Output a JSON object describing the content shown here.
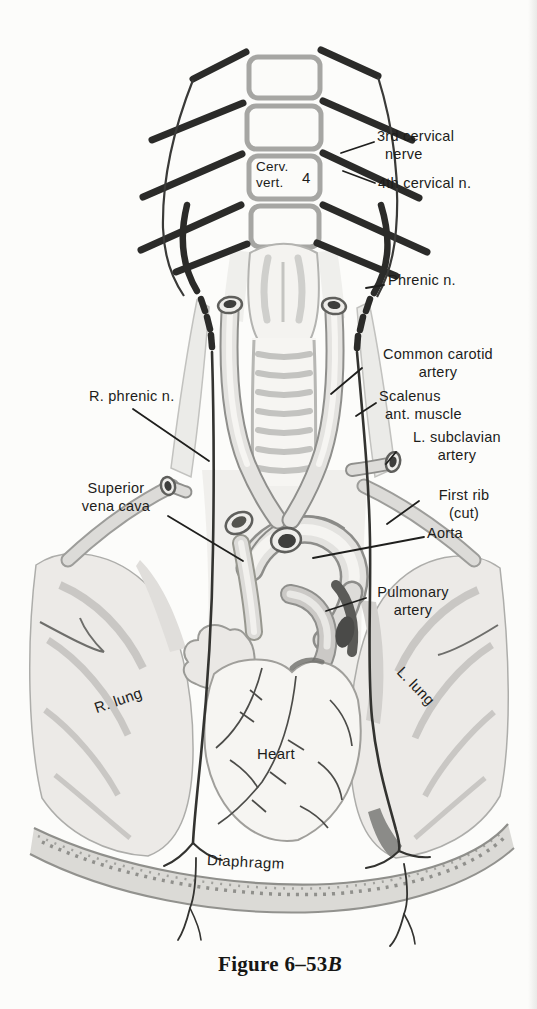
{
  "figure": {
    "caption_text": "Figure 6–53",
    "caption_italic": "B",
    "caption_full": "Figure 6–53B",
    "type": "anatomical-illustration"
  },
  "labels": {
    "third_cervical": {
      "line1": "3rd cervical",
      "line2": "nerve"
    },
    "fourth_cervical": {
      "line1": "4th cervical n."
    },
    "cerv_vert": {
      "line1": "Cerv.",
      "line2": "vert.",
      "number": "4"
    },
    "phrenic": {
      "line1": "Phrenic n."
    },
    "common_carotid": {
      "line1": "Common carotid",
      "line2": "artery"
    },
    "r_phrenic": {
      "line1": "R. phrenic n."
    },
    "scalenus": {
      "line1": "Scalenus",
      "line2": "ant. muscle"
    },
    "l_subclavian": {
      "line1": "L. subclavian",
      "line2": "artery"
    },
    "superior_vena_cava": {
      "line1": "Superior",
      "line2": "vena cava"
    },
    "first_rib": {
      "line1": "First rib",
      "line2": "(cut)"
    },
    "aorta": {
      "line1": "Aorta"
    },
    "pulmonary_artery": {
      "line1": "Pulmonary",
      "line2": "artery"
    },
    "r_lung": {
      "line1": "R. lung"
    },
    "l_lung": {
      "line1": "L. lung"
    },
    "heart": {
      "line1": "Heart"
    },
    "diaphragm": {
      "line1": "Diaphragm"
    }
  },
  "colors": {
    "ink": "#2b2b29",
    "label_text": "#1d1d1b",
    "outline_gray": "#a6a6a3",
    "shade_light": "#eceae8",
    "shade_mid": "#c6c4c2",
    "shade_dark": "#4a4a48",
    "paper": "#fcfcfa"
  }
}
